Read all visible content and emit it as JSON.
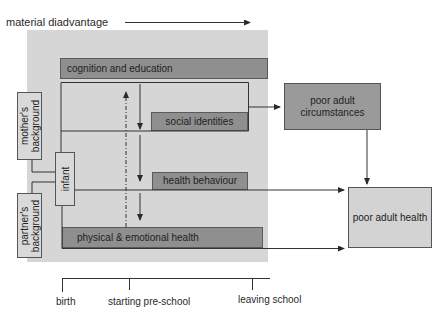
{
  "diagram": {
    "axis_title": "material diadvantage",
    "stages": {
      "cognition": "cognition and education",
      "social": "social identities",
      "health_behaviour": "health behaviour",
      "physical": "physical & emotional health"
    },
    "origins": {
      "mother": [
        "mother's",
        "background"
      ],
      "partner": [
        "partner's",
        "background"
      ],
      "infant": "infant"
    },
    "outcomes": {
      "circumstances": [
        "poor adult",
        "circumstances"
      ],
      "health": "poor adult health"
    },
    "timeline": {
      "birth": "birth",
      "preschool": "starting pre-school",
      "leaving": "leaving school"
    },
    "colors": {
      "panel": "#d6d6d6",
      "bar": "#8f8f8f",
      "outcome_dark": "#9a9a9a",
      "outcome_light": "#d3d3d3",
      "line": "#333333"
    }
  }
}
